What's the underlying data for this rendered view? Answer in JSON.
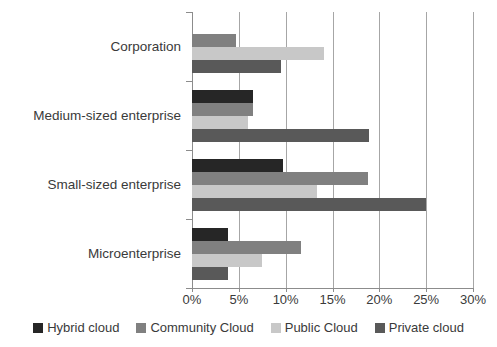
{
  "chart_data": {
    "type": "bar",
    "orientation": "horizontal",
    "title": "",
    "subtitle": "",
    "xlabel": "",
    "ylabel": "",
    "xlim": [
      0,
      30
    ],
    "xtick_values": [
      0,
      5,
      10,
      15,
      20,
      25,
      30
    ],
    "xtick_labels": [
      "0%",
      "5%",
      "10%",
      "15%",
      "20%",
      "25%",
      "30%"
    ],
    "grid": true,
    "grid_axis": "x",
    "legend_position": "bottom",
    "value_unit": "%",
    "categories": [
      "Corporation",
      "Medium-sized enterprise",
      "Small-sized enterprise",
      "Microenterprise"
    ],
    "series": [
      {
        "name": "Hybrid cloud",
        "color": "#262626",
        "values": [
          0,
          6.5,
          9.7,
          3.8
        ]
      },
      {
        "name": "Community Cloud",
        "color": "#808080",
        "values": [
          4.7,
          6.5,
          18.8,
          11.6
        ]
      },
      {
        "name": "Public Cloud",
        "color": "#c8c8c8",
        "values": [
          14.1,
          6.0,
          13.3,
          7.5
        ]
      },
      {
        "name": "Private cloud",
        "color": "#595959",
        "values": [
          9.5,
          18.9,
          25.0,
          3.8
        ]
      }
    ]
  },
  "axis": {
    "grid_color": "#a6a6a6",
    "axis_color": "#8c8c8c"
  }
}
